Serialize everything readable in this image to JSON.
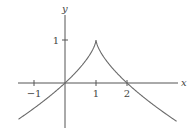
{
  "chart_data": {
    "type": "line",
    "title": "",
    "xlabel": "x",
    "ylabel": "y",
    "function": "y = 1 - |x - 1|^(2/3)",
    "xlim": [
      -1.5,
      3.6
    ],
    "ylim": [
      -1.0,
      1.6
    ],
    "x_ticks": [
      {
        "value": -1,
        "label": "−1"
      },
      {
        "value": 1,
        "label": "1"
      },
      {
        "value": 2,
        "label": "2"
      }
    ],
    "y_ticks": [
      {
        "value": 1,
        "label": "1"
      }
    ],
    "series": [
      {
        "name": "f",
        "points": [
          {
            "x": -1.5,
            "y": -0.842
          },
          {
            "x": -1.0,
            "y": -0.587
          },
          {
            "x": -0.5,
            "y": -0.31
          },
          {
            "x": 0.0,
            "y": 0.0
          },
          {
            "x": 0.5,
            "y": 0.37
          },
          {
            "x": 0.9,
            "y": 0.785
          },
          {
            "x": 1.0,
            "y": 1.0
          },
          {
            "x": 1.1,
            "y": 0.785
          },
          {
            "x": 1.5,
            "y": 0.37
          },
          {
            "x": 2.0,
            "y": 0.0
          },
          {
            "x": 2.5,
            "y": -0.31
          },
          {
            "x": 3.0,
            "y": -0.587
          },
          {
            "x": 3.6,
            "y": -0.891
          }
        ]
      }
    ],
    "annotations": [
      "cusp at (1, 1)"
    ],
    "grid": false,
    "legend": "none"
  }
}
